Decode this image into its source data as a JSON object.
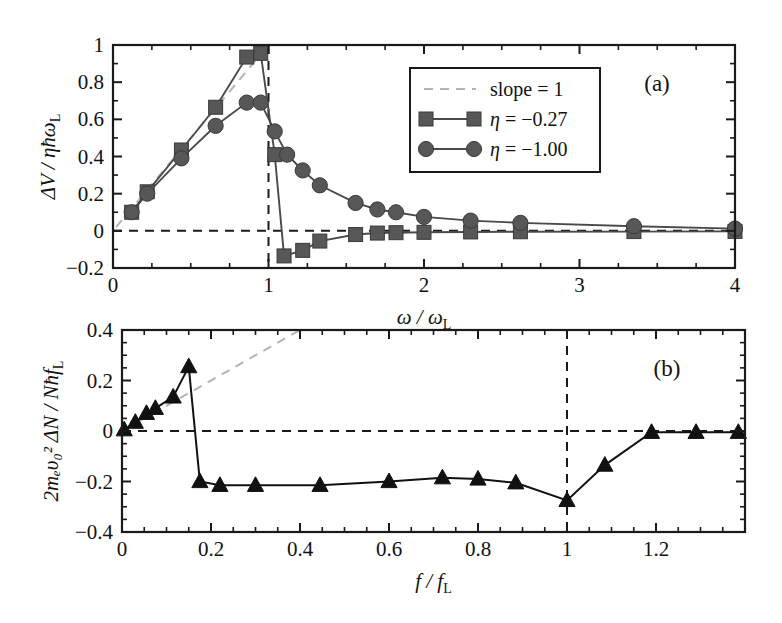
{
  "figure": {
    "background": "#ffffff",
    "ink": "#111111",
    "marker_gray": "#575757",
    "guide_gray": "#b4b4b4"
  },
  "chart_data": [
    {
      "type": "line",
      "panel": "a",
      "panel_label": "(a)",
      "title": "",
      "xlabel": "ω / ω",
      "xlabel_sub": "L",
      "ylabel": "ΔV / ηħω",
      "ylabel_sub": "L",
      "xlim": [
        0,
        4
      ],
      "ylim": [
        -0.2,
        1.0
      ],
      "xticks": [
        0,
        1,
        2,
        3,
        4
      ],
      "xticklabels": [
        "0",
        "1",
        "2",
        "3",
        "4"
      ],
      "xminor_step": 0.25,
      "yticks": [
        -0.2,
        0,
        0.2,
        0.4,
        0.6,
        0.8,
        1.0
      ],
      "yticklabels": [
        "-0.2",
        "0",
        "0.2",
        "0.4",
        "0.6",
        "0.8",
        "1"
      ],
      "yminor_step": 0.1,
      "grid": false,
      "reference_lines": [
        {
          "name": "zero-horizontal",
          "orientation": "horizontal",
          "value": 0,
          "style": "dashed",
          "color": "#1a1a1a"
        },
        {
          "name": "resonance-vertical",
          "orientation": "vertical",
          "value": 1.0,
          "style": "dashed",
          "color": "#1a1a1a"
        }
      ],
      "guide": {
        "name": "slope-1-guide",
        "label": "slope = 1",
        "style": "dashed",
        "color": "#b4b4b4",
        "points": [
          [
            0.02,
            0.02
          ],
          [
            0.95,
            0.95
          ]
        ]
      },
      "legend": {
        "position": "upper-right-inside",
        "entries": [
          {
            "label": "slope = 1",
            "marker": "none",
            "line": "dashed",
            "color": "#b4b4b4"
          },
          {
            "label": "η = −0.27",
            "marker": "square",
            "line": "solid",
            "color": "#575757"
          },
          {
            "label": "η = −1.00",
            "marker": "circle",
            "line": "solid",
            "color": "#575757"
          }
        ]
      },
      "series": [
        {
          "name": "η = −0.27",
          "marker": "square",
          "color": "#575757",
          "x": [
            0.12,
            0.22,
            0.44,
            0.66,
            0.86,
            0.95,
            1.04,
            1.1,
            1.22,
            1.33,
            1.56,
            1.7,
            1.82,
            2.0,
            2.3,
            2.62,
            3.35,
            4.0
          ],
          "y": [
            0.1,
            0.21,
            0.435,
            0.665,
            0.935,
            0.955,
            0.41,
            -0.135,
            -0.105,
            -0.055,
            -0.02,
            -0.012,
            -0.01,
            -0.008,
            -0.006,
            -0.005,
            -0.004,
            -0.003
          ]
        },
        {
          "name": "η = −1.00",
          "marker": "circle",
          "color": "#575757",
          "x": [
            0.12,
            0.22,
            0.44,
            0.66,
            0.86,
            0.95,
            1.04,
            1.12,
            1.22,
            1.33,
            1.56,
            1.7,
            1.82,
            2.0,
            2.3,
            2.62,
            3.35,
            4.0
          ],
          "y": [
            0.1,
            0.2,
            0.39,
            0.565,
            0.69,
            0.69,
            0.535,
            0.41,
            0.325,
            0.245,
            0.15,
            0.115,
            0.1,
            0.075,
            0.055,
            0.043,
            0.025,
            0.012
          ]
        }
      ]
    },
    {
      "type": "line",
      "panel": "b",
      "panel_label": "(b)",
      "title": "",
      "xlabel": "f / f",
      "xlabel_sub": "L",
      "ylabel": "2mₑυ₀² ΔN / Nħf",
      "ylabel_sub": "L",
      "xlim": [
        0,
        1.4
      ],
      "ylim": [
        -0.4,
        0.4
      ],
      "xticks": [
        0,
        0.2,
        0.4,
        0.6,
        0.8,
        1.0,
        1.2
      ],
      "xticklabels": [
        "0",
        "0.2",
        "0.4",
        "0.6",
        "0.8",
        "1",
        "1.2"
      ],
      "xminor_step": 0.05,
      "yticks": [
        -0.4,
        -0.2,
        0,
        0.2,
        0.4
      ],
      "yticklabels": [
        "-0.4",
        "-0.2",
        "0",
        "0.2",
        "0.4"
      ],
      "yminor_step": 0.05,
      "grid": false,
      "reference_lines": [
        {
          "name": "zero-horizontal",
          "orientation": "horizontal",
          "value": 0,
          "style": "dashed",
          "color": "#1a1a1a"
        },
        {
          "name": "resonance-vertical",
          "orientation": "vertical",
          "value": 1.0,
          "style": "dashed",
          "color": "#1a1a1a"
        }
      ],
      "guide": {
        "name": "slope-guide",
        "label": "",
        "style": "dashed",
        "color": "#b4b4b4",
        "points": [
          [
            0.005,
            0.005
          ],
          [
            0.4,
            0.4
          ]
        ]
      },
      "legend": null,
      "series": [
        {
          "name": "ΔN response",
          "marker": "triangle",
          "color": "#111111",
          "x": [
            0.005,
            0.03,
            0.055,
            0.075,
            0.115,
            0.15,
            0.175,
            0.22,
            0.3,
            0.445,
            0.6,
            0.72,
            0.8,
            0.885,
            1.0,
            1.085,
            1.19,
            1.29,
            1.385
          ],
          "y": [
            0.005,
            0.035,
            0.07,
            0.09,
            0.135,
            0.255,
            -0.2,
            -0.215,
            -0.215,
            -0.215,
            -0.2,
            -0.185,
            -0.19,
            -0.205,
            -0.275,
            -0.135,
            -0.005,
            -0.005,
            -0.005
          ]
        }
      ]
    }
  ]
}
